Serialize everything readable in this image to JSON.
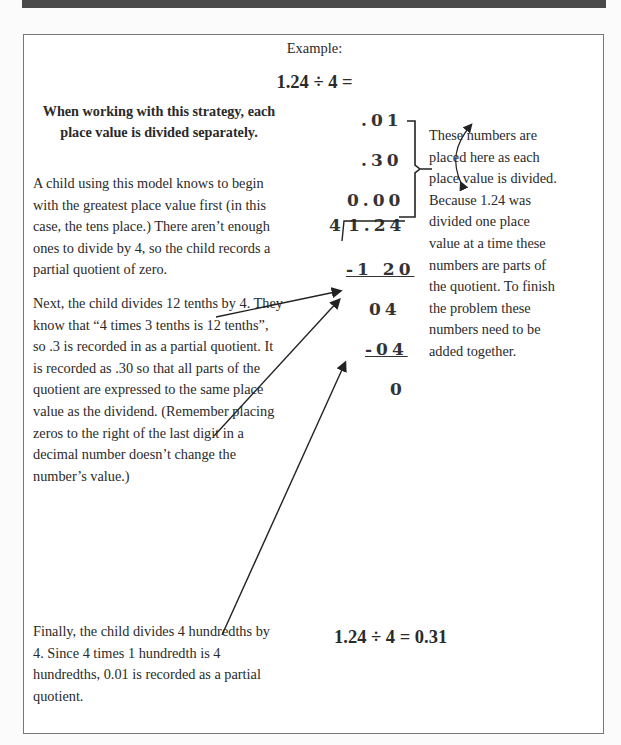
{
  "example": {
    "label": "Example:",
    "equation": "1.24 ÷ 4 ="
  },
  "left_column": {
    "heading": "When working with this strategy, each place value is divided separately.",
    "paragraphs": [
      "A child using this model knows to begin with the greatest place value first (in this case, the tens place.)  There aren’t enough ones to divide by 4, so the child records a partial quotient of zero.",
      "Next, the child divides 12 tenths by 4. They know that “4 times 3 tenths is 12 tenths”, so .3 is recorded in as a partial quotient. It is recorded as .30 so that all parts of the quotient are expressed to the same place value as the dividend. (Remember placing zeros to the right of the last digit in a decimal number doesn’t change the number’s value.)",
      "Finally, the child divides 4 hundredths by 4.  Since 4 times 1 hundredth is 4 hundredths, 0.01 is recorded as a partial quotient."
    ]
  },
  "division": {
    "partial_quotients": [
      ".01",
      ".30",
      "0.00"
    ],
    "divisor": "4",
    "dividend": "1.24",
    "steps": [
      "-1 20",
      "04",
      "-04",
      "0"
    ]
  },
  "right_column": {
    "note": "These numbers are placed here as each place value is divided. Because 1.24 was divided one place value at a time these numbers are parts of the quotient.  To finish the problem these numbers need to be added together."
  },
  "answer": "1.24 ÷ 4 = 0.31",
  "colors": {
    "top_bar": "#4a4a4a",
    "border": "#777777",
    "text": "#2a2a2a"
  }
}
